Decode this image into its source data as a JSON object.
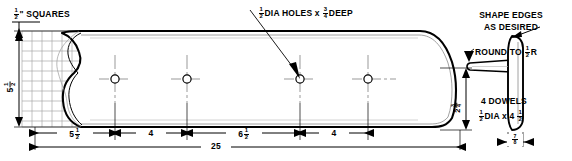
{
  "drawing": {
    "title": "Serving board / cutting board woodworking plan",
    "units": "inches",
    "overall_length": "25",
    "grid_note": {
      "whole": "",
      "num": "1",
      "den": "2",
      "suffix_unit": "\"",
      "text": "SQUARES",
      "full": "1/2\" SQUARES"
    },
    "notes": [
      {
        "id": "hole-note",
        "pre": "",
        "num": "1",
        "den": "2",
        "mid": "DIA HOLES x",
        "num2": "3",
        "den2": "4",
        "post": "DEEP",
        "full": "1/2 DIA HOLES x 3/4 DEEP"
      },
      {
        "id": "shape-edges-note",
        "line1": "SHAPE EDGES",
        "line2": "AS DESIRED",
        "full": "SHAPE EDGES AS DESIRED"
      },
      {
        "id": "round-note",
        "pre": "ROUND TO",
        "num": "1",
        "den": "2",
        "post": "R",
        "full": "ROUND TO 1/2 R"
      },
      {
        "id": "dowels-note",
        "line1": "4 DOWELS",
        "num": "1",
        "den": "2",
        "mid": "DIA x 4",
        "num2": "1",
        "den2": "2",
        "full": "4 DOWELS 1/2 DIA x 4 1/2"
      }
    ],
    "dimensions": [
      {
        "id": "height-left",
        "whole": "5",
        "num": "1",
        "den": "2",
        "full": "5 1/2",
        "orientation": "vertical"
      },
      {
        "id": "seg-1",
        "whole": "5",
        "num": "1",
        "den": "2",
        "full": "5 1/2",
        "orientation": "horizontal"
      },
      {
        "id": "seg-2",
        "whole": "4",
        "num": "",
        "den": "",
        "full": "4",
        "orientation": "horizontal"
      },
      {
        "id": "seg-3",
        "whole": "6",
        "num": "1",
        "den": "2",
        "full": "6 1/2",
        "orientation": "horizontal"
      },
      {
        "id": "seg-4",
        "whole": "4",
        "num": "",
        "den": "",
        "full": "4",
        "orientation": "horizontal"
      },
      {
        "id": "overall",
        "whole": "25",
        "num": "",
        "den": "",
        "full": "25",
        "orientation": "horizontal"
      },
      {
        "id": "neck-height",
        "whole": "2",
        "num": "3",
        "den": "4",
        "full": "2 3/4",
        "orientation": "vertical"
      },
      {
        "id": "thickness",
        "whole": "",
        "num": "7",
        "den": "8",
        "full": "7/8",
        "orientation": "horizontal"
      }
    ],
    "colors": {
      "ink": "#000000",
      "paper": "#ffffff",
      "grid": "#9a9a9a",
      "thin": "#555555",
      "center": "#6e6e6e"
    },
    "holes": {
      "count": 4,
      "label": "dowel-hole"
    }
  }
}
